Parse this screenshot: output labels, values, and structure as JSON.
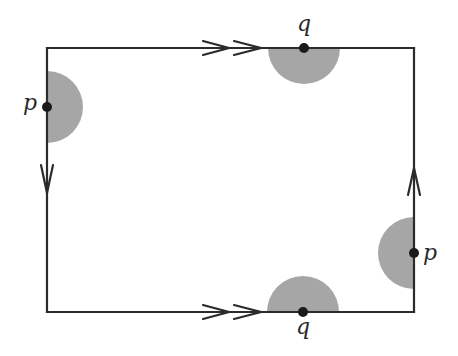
{
  "diagram": {
    "type": "polygon-identification",
    "colors": {
      "edge": "#2b2b2b",
      "shade": "#a6a6a6",
      "vertex": "#1a1a1a",
      "background": "#ffffff"
    },
    "rectangle": {
      "x1": 47,
      "y1": 48,
      "x2": 414,
      "y2": 312
    },
    "edges": [
      {
        "name": "top",
        "arrow": "double",
        "direction": "right"
      },
      {
        "name": "bottom",
        "arrow": "double",
        "direction": "right"
      },
      {
        "name": "left",
        "arrow": "single",
        "direction": "down"
      },
      {
        "name": "right",
        "arrow": "single",
        "direction": "up"
      }
    ],
    "points": [
      {
        "id": "p-left",
        "label": "p",
        "edge": "left",
        "x": 47,
        "y": 107,
        "half_disk_side": "right"
      },
      {
        "id": "q-top",
        "label": "q",
        "edge": "top",
        "x": 304,
        "y": 48,
        "half_disk_side": "below"
      },
      {
        "id": "p-right",
        "label": "p",
        "edge": "right",
        "x": 414,
        "y": 253,
        "half_disk_side": "left"
      },
      {
        "id": "q-bottom",
        "label": "q",
        "edge": "bottom",
        "x": 303,
        "y": 312,
        "half_disk_side": "above"
      }
    ]
  },
  "labels": {
    "p_left": "p",
    "q_top": "q",
    "p_right": "p",
    "q_bottom": "q"
  }
}
